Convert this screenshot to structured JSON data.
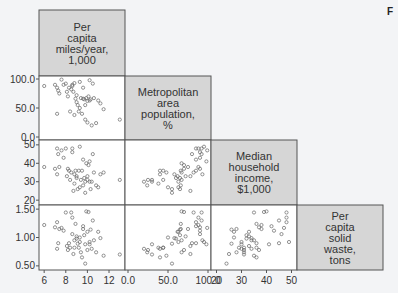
{
  "corner_fragment": "F",
  "colors": {
    "background": "#f3f4f6",
    "panel_bg": "#ffffff",
    "diag_bg": "#d6d6d6",
    "border": "#555555",
    "marker": "#666666",
    "text": "#333333"
  },
  "chart_data": {
    "type": "scatter",
    "subtype": "scatterplot-matrix-lower-triangle",
    "title": "",
    "variables": [
      {
        "key": "miles",
        "label": [
          "Per",
          "capita",
          "miles/year,",
          "1,000"
        ],
        "range": [
          5.8,
          13.2
        ],
        "ticks": [
          6,
          8,
          10,
          12
        ],
        "tick_labels": [
          "6",
          "8",
          "10",
          "12"
        ]
      },
      {
        "key": "metro",
        "label": [
          "Metropolitan",
          "area",
          "population,",
          "%"
        ],
        "range": [
          0,
          100
        ],
        "ticks": [
          0,
          50,
          100
        ],
        "tick_labels": [
          "0.0",
          "50.0",
          "100.0"
        ]
      },
      {
        "key": "income",
        "label": [
          "Median",
          "household",
          "income,",
          "$1,000"
        ],
        "range": [
          19,
          51
        ],
        "ticks": [
          20,
          30,
          40,
          50
        ],
        "tick_labels": [
          "20",
          "30",
          "40",
          "50"
        ]
      },
      {
        "key": "waste",
        "label": [
          "Per",
          "capita",
          "solid",
          "waste,",
          "tons"
        ],
        "range": [
          0.48,
          1.52
        ],
        "ticks": [
          0.5,
          1.0,
          1.5
        ],
        "tick_labels": [
          "0.50",
          "1.00",
          "1.50"
        ]
      }
    ],
    "grid": false,
    "legend": null,
    "points": [
      {
        "miles": 6.0,
        "metro": 88,
        "income": 38,
        "waste": 1.22
      },
      {
        "miles": 7.0,
        "metro": 90,
        "income": 37,
        "waste": 1.18
      },
      {
        "miles": 7.2,
        "metro": 85,
        "income": 48,
        "waste": 1.27
      },
      {
        "miles": 7.3,
        "metro": 80,
        "income": 45,
        "waste": 0.9
      },
      {
        "miles": 7.4,
        "metro": 75,
        "income": 38,
        "waste": 1.15
      },
      {
        "miles": 7.2,
        "metro": 40,
        "income": 34,
        "waste": 0.8
      },
      {
        "miles": 7.6,
        "metro": 99,
        "income": 47,
        "waste": 1.17
      },
      {
        "miles": 7.8,
        "metro": 90,
        "income": 43,
        "waste": 1.12
      },
      {
        "miles": 8.0,
        "metro": 92,
        "income": 48,
        "waste": 1.44
      },
      {
        "miles": 8.1,
        "metro": 78,
        "income": 33,
        "waste": 0.85
      },
      {
        "miles": 8.3,
        "metro": 85,
        "income": 36,
        "waste": 0.9
      },
      {
        "miles": 8.4,
        "metro": 44,
        "income": 31,
        "waste": 0.82
      },
      {
        "miles": 8.5,
        "metro": 82,
        "income": 35,
        "waste": 1.44
      },
      {
        "miles": 8.6,
        "metro": 90,
        "income": 46,
        "waste": 1.06
      },
      {
        "miles": 8.7,
        "metro": 78,
        "income": 25,
        "waste": 0.71
      },
      {
        "miles": 8.8,
        "metro": 93,
        "income": 34,
        "waste": 0.95
      },
      {
        "miles": 8.8,
        "metro": 38,
        "income": 29,
        "waste": 0.82
      },
      {
        "miles": 8.9,
        "metro": 66,
        "income": 36,
        "waste": 1.24
      },
      {
        "miles": 9.0,
        "metro": 60,
        "income": 32,
        "waste": 0.98
      },
      {
        "miles": 9.1,
        "metro": 55,
        "income": 26,
        "waste": 0.89
      },
      {
        "miles": 9.2,
        "metro": 44,
        "income": 36,
        "waste": 0.82
      },
      {
        "miles": 9.3,
        "metro": 50,
        "income": 27,
        "waste": 1.0
      },
      {
        "miles": 9.4,
        "metro": 67,
        "income": 31,
        "waste": 0.74
      },
      {
        "miles": 9.5,
        "metro": 40,
        "income": 36,
        "waste": 0.65
      },
      {
        "miles": 9.6,
        "metro": 66,
        "income": 28,
        "waste": 1.15
      },
      {
        "miles": 9.7,
        "metro": 65,
        "income": 32,
        "waste": 1.04
      },
      {
        "miles": 9.8,
        "metro": 55,
        "income": 24,
        "waste": 0.54
      },
      {
        "miles": 9.8,
        "metro": 30,
        "income": 30,
        "waste": 0.88
      },
      {
        "miles": 9.9,
        "metro": 67,
        "income": 40,
        "waste": 1.46
      },
      {
        "miles": 10.0,
        "metro": 62,
        "income": 33,
        "waste": 1.1
      },
      {
        "miles": 10.0,
        "metro": 25,
        "income": 31,
        "waste": 0.78
      },
      {
        "miles": 10.1,
        "metro": 70,
        "income": 39,
        "waste": 1.45
      },
      {
        "miles": 10.2,
        "metro": 63,
        "income": 30,
        "waste": 0.92
      },
      {
        "miles": 10.3,
        "metro": 65,
        "income": 26,
        "waste": 1.14
      },
      {
        "miles": 10.4,
        "metro": 20,
        "income": 30,
        "waste": 0.8
      },
      {
        "miles": 10.6,
        "metro": 67,
        "income": 35,
        "waste": 0.95
      },
      {
        "miles": 10.8,
        "metro": 24,
        "income": 28,
        "waste": 0.74
      },
      {
        "miles": 11.0,
        "metro": 63,
        "income": 27,
        "waste": 1.1
      },
      {
        "miles": 11.2,
        "metro": 58,
        "income": 34,
        "waste": 0.99
      },
      {
        "miles": 11.5,
        "metro": 48,
        "income": 35,
        "waste": 0.68
      },
      {
        "miles": 13.0,
        "metro": 30,
        "income": 31,
        "waste": 0.7
      },
      {
        "miles": 9.0,
        "metro": 72,
        "income": 33,
        "waste": 1.02
      },
      {
        "miles": 8.2,
        "metro": 70,
        "income": 37,
        "waste": 0.78
      },
      {
        "miles": 9.6,
        "metro": 85,
        "income": 42,
        "waste": 1.2
      },
      {
        "miles": 10.5,
        "metro": 92,
        "income": 45,
        "waste": 1.3
      },
      {
        "miles": 8.6,
        "metro": 88,
        "income": 48,
        "waste": 1.35
      },
      {
        "miles": 9.3,
        "metro": 95,
        "income": 49,
        "waste": 0.92
      },
      {
        "miles": 10.2,
        "metro": 98,
        "income": 41,
        "waste": 0.88
      }
    ]
  }
}
